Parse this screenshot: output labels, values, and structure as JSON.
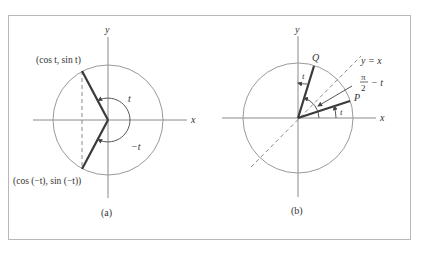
{
  "figure": {
    "frame": {
      "stroke": "#b8b8b8"
    },
    "colors": {
      "axis": "#8a8a8a",
      "circle": "#9a9a9a",
      "radius": "#3a3a3a",
      "dashed": "#8a8a8a",
      "text": "#333333"
    },
    "panel_a": {
      "caption": "(a)",
      "x_label": "x",
      "y_label": "y",
      "point_top_label": "(cos t,  sin t)",
      "point_bottom_label": "(cos (−t),  sin (−t))",
      "angle_pos_label": "t",
      "angle_neg_label": "−t"
    },
    "panel_b": {
      "caption": "(b)",
      "x_label": "x",
      "y_label": "y",
      "point_q_label": "Q",
      "point_p_label": "P",
      "line_label": "y = x",
      "angle_t_label_q": "t",
      "angle_t_label_p": "t",
      "complement_num": "π",
      "complement_den": "2",
      "complement_rest": "− t"
    }
  }
}
